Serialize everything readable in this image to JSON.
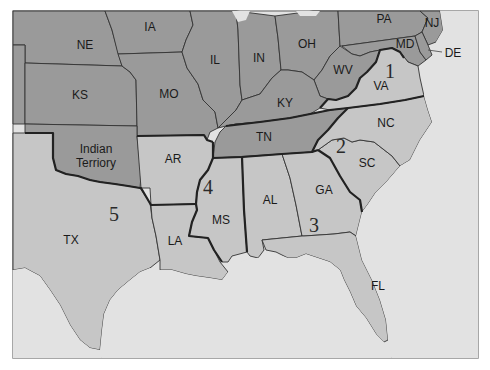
{
  "map": {
    "colors": {
      "water": "#e2e2e2",
      "union_states": "#9a9a9a",
      "confederate_states": "#c6c6c6",
      "border": "#333333",
      "campaign_border": "#222222"
    },
    "states": {
      "ne": "NE",
      "ia": "IA",
      "il": "IL",
      "in": "IN",
      "oh": "OH",
      "pa": "PA",
      "nj": "NJ",
      "md": "MD",
      "de": "DE",
      "wv": "WV",
      "va": "VA",
      "ks": "KS",
      "mo": "MO",
      "ky": "KY",
      "nc": "NC",
      "tn": "TN",
      "sc": "SC",
      "ar": "AR",
      "it_line1": "Indian",
      "it_line2": "Terriory",
      "ga": "GA",
      "al": "AL",
      "ms": "MS",
      "la": "LA",
      "tx": "TX",
      "fl": "FL"
    },
    "regions": {
      "r1": "1",
      "r2": "2",
      "r3": "3",
      "r4": "4",
      "r5": "5"
    }
  }
}
